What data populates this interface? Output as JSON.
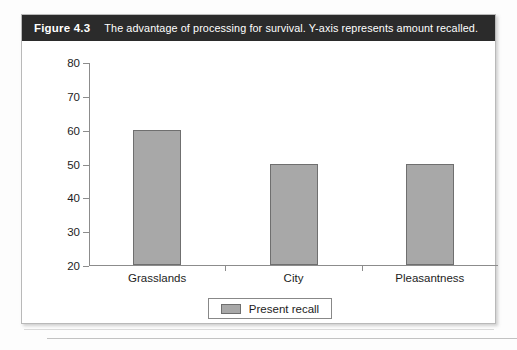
{
  "figure": {
    "label": "Figure 4.3",
    "caption": "The advantage of processing for survival. Y-axis represents amount recalled."
  },
  "legend": {
    "swatch_color": "#a8a8a8",
    "entries": [
      {
        "label": "Present recall",
        "color": "#a8a8a8"
      }
    ]
  },
  "chart_data": {
    "type": "bar",
    "title": "",
    "xlabel": "",
    "ylabel": "",
    "categories": [
      "Grasslands",
      "City",
      "Pleasantness"
    ],
    "values": [
      60,
      50,
      50
    ],
    "series": [
      {
        "name": "Present recall",
        "values": [
          60,
          50,
          50
        ],
        "color": "#a8a8a8"
      }
    ],
    "ylim": [
      20,
      80
    ],
    "yticks": [
      20,
      30,
      40,
      50,
      60,
      70,
      80
    ],
    "ytick_labels": [
      "20",
      "30",
      "40",
      "50",
      "60",
      "70",
      "80"
    ],
    "grid": false,
    "legend_position": "bottom-center"
  }
}
